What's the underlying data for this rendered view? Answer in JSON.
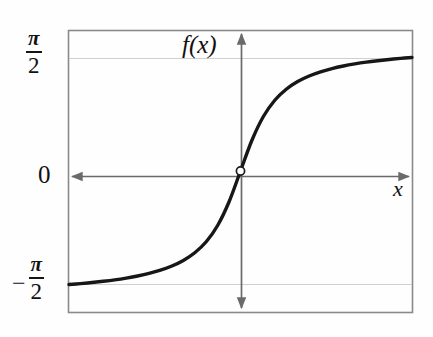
{
  "figure": {
    "title": "",
    "background_color": "#fefefe",
    "frame_color": "#8a8a8a",
    "curve_color": "#171717",
    "gridline_color": "#cfcfcf",
    "axis_color": "#6a6a6a"
  },
  "labels": {
    "y_axis_name": "f(x)",
    "x_axis_name": "x",
    "y_tick_top_numerator": "π",
    "y_tick_top_denominator": "2",
    "y_tick_origin": "0",
    "y_tick_bottom_sign": "−",
    "y_tick_bottom_numerator": "π",
    "y_tick_bottom_denominator": "2"
  },
  "chart_data": {
    "type": "line",
    "title": "",
    "xlabel": "x",
    "ylabel": "f(x)",
    "function": "arctan(x)",
    "xlim": [
      -6,
      6
    ],
    "ylim": [
      -1.7453,
      1.7453
    ],
    "grid": true,
    "legend": false,
    "y_ticks": [
      1.5708,
      0,
      -1.5708
    ],
    "y_tick_labels": [
      "π/2",
      "0",
      "-π/2"
    ],
    "x_ticks": [],
    "x_tick_labels": [],
    "asymptotes": [
      1.5708,
      -1.5708
    ],
    "markers": [
      {
        "name": "origin",
        "x": 0,
        "y": 0,
        "style": "open-circle"
      }
    ],
    "series": [
      {
        "name": "arctan(x)",
        "x": [
          -6.0,
          -5.6,
          -5.2,
          -4.8,
          -4.4,
          -4.0,
          -3.6,
          -3.2,
          -2.8,
          -2.4,
          -2.0,
          -1.6,
          -1.2,
          -0.8,
          -0.4,
          0.0,
          0.4,
          0.8,
          1.2,
          1.6,
          2.0,
          2.4,
          2.8,
          3.2,
          3.6,
          4.0,
          4.4,
          4.8,
          5.2,
          5.6,
          6.0
        ],
        "y": [
          -1.4056,
          -1.3935,
          -1.3805,
          -1.3654,
          -1.3478,
          -1.3258,
          -1.2997,
          -1.2679,
          -1.2278,
          -1.176,
          -1.1071,
          -1.0122,
          -0.8761,
          -0.6747,
          -0.3805,
          0.0,
          0.3805,
          0.6747,
          0.8761,
          1.0122,
          1.1071,
          1.176,
          1.2278,
          1.2679,
          1.2997,
          1.3258,
          1.3478,
          1.3654,
          1.3805,
          1.3935,
          1.4056
        ]
      }
    ]
  }
}
